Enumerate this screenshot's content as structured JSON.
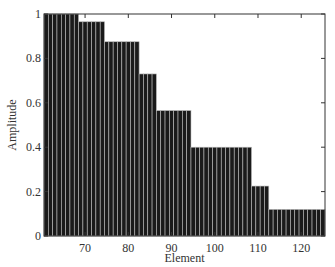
{
  "chart_data": {
    "type": "bar",
    "title": "",
    "xlabel": "Element",
    "ylabel": "Amplitude",
    "xlim": [
      60.5,
      125.5
    ],
    "ylim": [
      0,
      1
    ],
    "xticks": [
      70,
      80,
      90,
      100,
      110,
      120
    ],
    "yticks": [
      0,
      0.2,
      0.4,
      0.6,
      0.8,
      1
    ],
    "ytick_labels": [
      "0",
      "0.2",
      "0.4",
      "0.6",
      "0.8",
      "1"
    ],
    "grid": false,
    "legend": null,
    "bar_color": "#1a1a1a",
    "bar_edge_color": "#bbbbbb",
    "groups": [
      {
        "from": 61,
        "to": 68,
        "value": 1.0
      },
      {
        "from": 69,
        "to": 74,
        "value": 0.965
      },
      {
        "from": 75,
        "to": 82,
        "value": 0.875
      },
      {
        "from": 83,
        "to": 86,
        "value": 0.73
      },
      {
        "from": 87,
        "to": 94,
        "value": 0.565
      },
      {
        "from": 95,
        "to": 108,
        "value": 0.4
      },
      {
        "from": 109,
        "to": 112,
        "value": 0.225
      },
      {
        "from": 113,
        "to": 125,
        "value": 0.12
      }
    ]
  }
}
